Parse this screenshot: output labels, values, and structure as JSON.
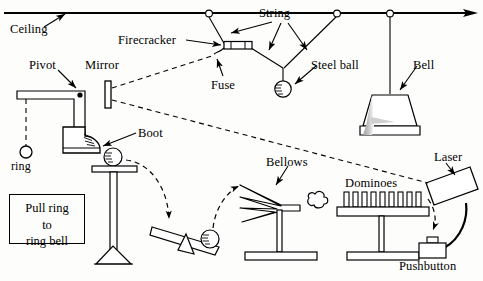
{
  "figure": {
    "background_color": "#fdfdfc",
    "ink_color": "#000000",
    "shade_color": "#a9a9a9"
  },
  "labels": {
    "ceiling": "Ceiling",
    "firecracker": "Firecracker",
    "string": "String",
    "steel_ball": "Steel ball",
    "bell": "Bell",
    "fuse": "Fuse",
    "pivot": "Pivot",
    "mirror": "Mirror",
    "boot": "Boot",
    "ring": "ring",
    "bellows": "Bellows",
    "dominoes": "Dominoes",
    "laser": "Laser",
    "pushbutton": "Pushbutton"
  },
  "instruction_box": {
    "line1": "Pull ring",
    "line2": "to",
    "line3": "ring bell"
  },
  "components": [
    {
      "name": "ceiling",
      "label": "Ceiling",
      "kind": "structure"
    },
    {
      "name": "pivot",
      "label": "Pivot",
      "kind": "hinge"
    },
    {
      "name": "mirror",
      "label": "Mirror",
      "kind": "optical"
    },
    {
      "name": "firecracker",
      "label": "Firecracker",
      "kind": "explosive"
    },
    {
      "name": "fuse",
      "label": "Fuse",
      "kind": "explosive"
    },
    {
      "name": "string",
      "label": "String",
      "kind": "linkage"
    },
    {
      "name": "steel-ball",
      "label": "Steel ball",
      "kind": "mass"
    },
    {
      "name": "bell",
      "label": "Bell",
      "kind": "output"
    },
    {
      "name": "boot",
      "label": "Boot",
      "kind": "actuator"
    },
    {
      "name": "ring",
      "label": "ring",
      "kind": "input"
    },
    {
      "name": "bellows",
      "label": "Bellows",
      "kind": "actuator"
    },
    {
      "name": "dominoes",
      "label": "Dominoes",
      "kind": "chain"
    },
    {
      "name": "laser",
      "label": "Laser",
      "kind": "optical"
    },
    {
      "name": "pushbutton",
      "label": "Pushbutton",
      "kind": "switch"
    }
  ],
  "counts": {
    "ceiling_anchor_rings": 3,
    "dominoes": 9,
    "bellows_folds": 4,
    "balls": 3
  },
  "label_positions": {
    "ceiling": {
      "x": 10,
      "y": 30
    },
    "firecracker": {
      "x": 118,
      "y": 33
    },
    "string": {
      "x": 259,
      "y": 12
    },
    "steel_ball": {
      "x": 315,
      "y": 58
    },
    "bell": {
      "x": 413,
      "y": 58
    },
    "fuse": {
      "x": 215,
      "y": 79
    },
    "pivot": {
      "x": 29,
      "y": 63
    },
    "mirror": {
      "x": 85,
      "y": 61
    },
    "boot": {
      "x": 114,
      "y": 127
    },
    "ring": {
      "x": 11,
      "y": 163
    },
    "bellows": {
      "x": 268,
      "y": 157
    },
    "dominoes": {
      "x": 345,
      "y": 177
    },
    "laser": {
      "x": 435,
      "y": 153
    },
    "pushbutton": {
      "x": 401,
      "y": 261
    }
  },
  "instruction_box_geometry": {
    "x": 9,
    "y": 194,
    "width": 76,
    "height": 50
  }
}
